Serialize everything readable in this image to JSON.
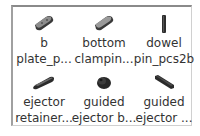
{
  "panel": {
    "items": [
      {
        "icon": "plate-part-icon",
        "line1": "b",
        "line2": "plate_p..."
      },
      {
        "icon": "plate-part-icon",
        "line1": "bottom",
        "line2": "clampin..."
      },
      {
        "icon": "pin-part-icon",
        "line1": "dowel",
        "line2": "pin_pcs2b"
      },
      {
        "icon": "bar-part-icon",
        "line1": "ejector",
        "line2": "retainer..."
      },
      {
        "icon": "bushing-part-icon",
        "line1": "guided",
        "line2": "ejector b..."
      },
      {
        "icon": "rod-part-icon",
        "line1": "guided",
        "line2": "ejector ..."
      }
    ]
  }
}
